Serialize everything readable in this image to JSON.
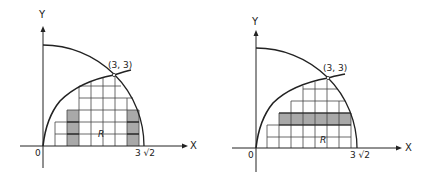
{
  "figures": [
    {
      "id": "left",
      "y_axis_label": "Y",
      "x_axis_label": "X",
      "origin_label": "0",
      "intersection_label": "(3, 3)",
      "radius_label": "3 √2",
      "region_label": "R",
      "shading": "vertical strips",
      "colors": {
        "line": "#222222",
        "grid": "#444444",
        "shade": "#a9a9a9"
      }
    },
    {
      "id": "right",
      "y_axis_label": "Y",
      "x_axis_label": "X",
      "origin_label": "0",
      "intersection_label": "(3, 3)",
      "radius_label": "3 √2",
      "region_label": "R",
      "shading": "horizontal strip",
      "colors": {
        "line": "#222222",
        "grid": "#444444",
        "shade": "#a9a9a9"
      }
    }
  ]
}
